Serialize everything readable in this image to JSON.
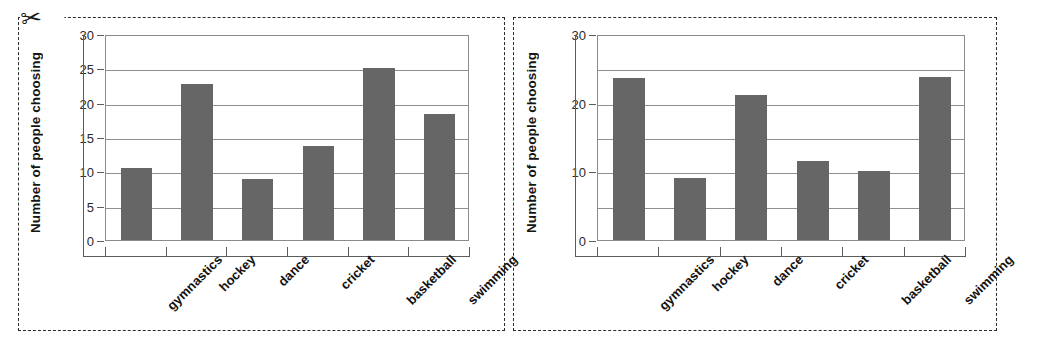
{
  "page": {
    "background": "#ffffff",
    "cut_icon": "scissors-icon",
    "cut_glyph": "✂",
    "bar_color": "#666666",
    "grid_color": "#8f8f8f",
    "axis_color": "#5c5c5c",
    "border_style": "dashed"
  },
  "chart_data": [
    {
      "id": "left",
      "type": "bar",
      "title": "",
      "xlabel": "",
      "ylabel": "Number of people choosing",
      "categories": [
        "gymnastics",
        "hockey",
        "dance",
        "cricket",
        "basketball",
        "swimming"
      ],
      "values": [
        10.5,
        22.7,
        8.9,
        13.7,
        25.0,
        18.4
      ],
      "ylim": [
        0,
        30
      ],
      "ytick_labels": [
        "0",
        "5",
        "10",
        "15",
        "20",
        "25",
        "30"
      ],
      "ytick_values": [
        0,
        5,
        10,
        15,
        20,
        25,
        30
      ],
      "gridline_values": [
        5,
        10,
        15,
        20,
        25,
        30
      ],
      "grid": true,
      "legend": "none"
    },
    {
      "id": "right",
      "type": "bar",
      "title": "",
      "xlabel": "",
      "ylabel": "Number of people choosing",
      "categories": [
        "gymnastics",
        "hockey",
        "dance",
        "cricket",
        "basketball",
        "swimming"
      ],
      "values": [
        23.6,
        9.1,
        21.1,
        11.5,
        10.0,
        23.7
      ],
      "ylim": [
        0,
        30
      ],
      "ytick_labels": [
        "0",
        "10",
        "20",
        "30"
      ],
      "ytick_values": [
        0,
        10,
        20,
        30
      ],
      "gridline_values": [
        5,
        10,
        15,
        20,
        25,
        30
      ],
      "grid": true,
      "legend": "none"
    }
  ]
}
